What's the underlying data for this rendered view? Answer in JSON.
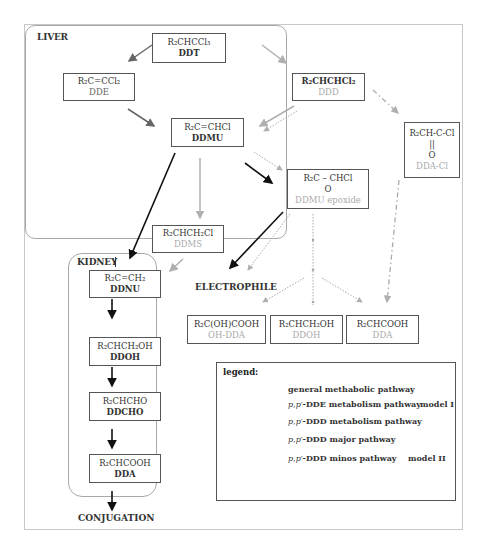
{
  "regions": {
    "liver": "LIVER",
    "kidney": "KIDNEY"
  },
  "compounds": {
    "ddt": {
      "formula": "R₂CHCCl₃",
      "name": "DDT"
    },
    "dde": {
      "formula": "R₂C=CCl₂",
      "name": "DDE"
    },
    "ddd": {
      "formula": "R₂CHCHCl₂",
      "name": "DDD"
    },
    "ddmu": {
      "formula": "R₂C=CHCl",
      "name": "DDMU"
    },
    "ddmu_epoxide": {
      "formula": "R₂C – CHCl",
      "oxygen": "O",
      "name": "DDMU epoxide"
    },
    "dda_cl": {
      "formula": "R₂CH-C-Cl",
      "bond": "||",
      "oxygen": "O",
      "name": "DDA-Cl"
    },
    "ddms": {
      "formula": "R₂CHCH₂Cl",
      "name": "DDMS"
    },
    "ddnu": {
      "formula": "R₂C=CH₂",
      "name": "DDNU"
    },
    "ddoh_kidney": {
      "formula": "R₂CHCH₂OH",
      "name": "DDOH"
    },
    "ddcho": {
      "formula": "R₂CHCHO",
      "name": "DDCHO"
    },
    "dda_kidney": {
      "formula": "R₂CHCOOH",
      "name": "DDA"
    },
    "oh_dda": {
      "formula": "R₂C(OH)COOH",
      "name": "OH-DDA"
    },
    "ddoh": {
      "formula": "R₂CHCH₂OH",
      "name": "DDOH"
    },
    "dda": {
      "formula": "R₂CHCOOH",
      "name": "DDA"
    }
  },
  "labels": {
    "electrophile": "ELECTROPHILE",
    "conjugation": "CONJUGATION"
  },
  "legend": {
    "title": "legend:",
    "items": [
      {
        "prefix": "",
        "text": "general methabolic pathway",
        "style": "solid-black"
      },
      {
        "prefix": "p,p′",
        "text": "-DDE metabolism pathway",
        "style": "solid-gray"
      },
      {
        "prefix": "p,p′",
        "text": "-DDD metabolism pathway",
        "style": "solid-lightgray"
      },
      {
        "prefix": "p,p′",
        "text": "-DDD major pathway",
        "style": "dash-dot"
      },
      {
        "prefix": "p,p′",
        "text": "-DDD minos pathway",
        "style": "dotted"
      }
    ],
    "model_1": "model I",
    "model_2": "model II"
  },
  "colors": {
    "general": "#111111",
    "dde_pathway": "#666666",
    "ddd_pathway": "#b0b0b0",
    "ddd_major": "#aaaaaa",
    "ddd_minor": "#aaaaaa",
    "gray_text": "#aaaaaa"
  }
}
